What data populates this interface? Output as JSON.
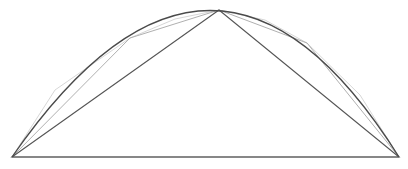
{
  "diagram": {
    "title": "",
    "colors": {
      "background": "#ffffff",
      "curve": "#4a4a4a",
      "main_triangle": "#555555",
      "chord": "#666666",
      "sub_triangles": "#b8b8b8"
    },
    "points": {
      "A": [
        12,
        157
      ],
      "C": [
        219,
        10
      ],
      "B": [
        399,
        157
      ],
      "D": [
        130,
        38
      ],
      "E": [
        307,
        43
      ]
    },
    "curve_path": "M 12 157 Q 215 -136 399 157",
    "main_triangle": "12,157 219,10 399,157",
    "sub_triangle_left": "12,157 130,38 219,10",
    "sub_triangle_right": "219,10 307,43 399,157",
    "tertiary_left": [
      "12,157 55,90 130,38",
      "130,38 175,19 219,10"
    ],
    "tertiary_right": [
      "219,10 265,20 307,43",
      "307,43 360,95 399,157"
    ]
  }
}
